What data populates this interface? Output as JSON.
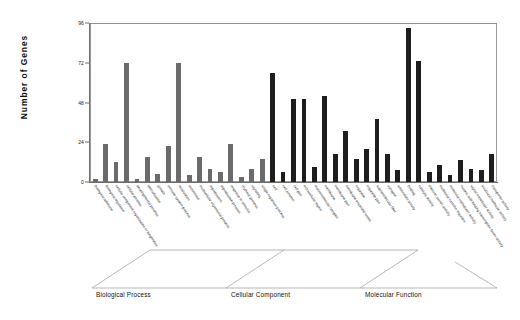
{
  "chart_data": {
    "type": "bar",
    "title": "",
    "xlabel": "",
    "ylabel": "Number of Genes",
    "ylim": [
      0,
      96
    ],
    "yticks": [
      0,
      24,
      48,
      72,
      96
    ],
    "grid": false,
    "legend": "none",
    "groups": [
      {
        "name": "Biological Process",
        "color": "#6b6b6b",
        "categories": [
          "biological adhesion",
          "biological regulation",
          "cellular component organization or biogenesis",
          "cellular process",
          "developmental process",
          "detoxification",
          "growth",
          "immune system process",
          "localization",
          "locomotion",
          "multicellular organismal process",
          "reproduction",
          "reproductive process",
          "response to stimulus",
          "rhythmic process",
          "signaling",
          "single-organism process"
        ],
        "values": [
          2,
          23,
          12,
          72,
          2,
          15,
          5,
          22,
          72,
          4,
          15,
          8,
          6,
          23,
          3,
          8,
          14
        ]
      },
      {
        "name": "Cellular Component",
        "color": "#1e1e1e",
        "categories": [
          "cell",
          "cell junction",
          "cell part",
          "extracellular region",
          "macromolecular complex",
          "membrane",
          "membrane part",
          "membrane-enclosed lumen",
          "organelle",
          "organelle part",
          "supramolecular fiber",
          "synapse"
        ],
        "values": [
          66,
          6,
          50,
          50,
          9,
          52,
          17,
          31,
          14,
          20,
          38,
          17
        ]
      },
      {
        "name": "Molecular Function",
        "color": "#1e1e1e",
        "categories": [
          "antioxidant activity",
          "binding",
          "catalytic activity",
          "electron carrier activity",
          "molecular function regulator",
          "molecular transducer activity",
          "nucleic acid binding transcription factor activity",
          "signal transducer activity",
          "structural molecule activity",
          "transporter activity"
        ],
        "values": [
          7,
          93,
          73,
          6,
          10,
          4,
          13,
          8,
          7,
          17
        ]
      }
    ]
  },
  "axis": {
    "y_title": "Number of Genes",
    "y_tick_labels": [
      "0",
      "24",
      "48",
      "72",
      "96"
    ]
  },
  "group_labels": [
    "Biological Process",
    "Cellular Component",
    "Molecular Function"
  ]
}
